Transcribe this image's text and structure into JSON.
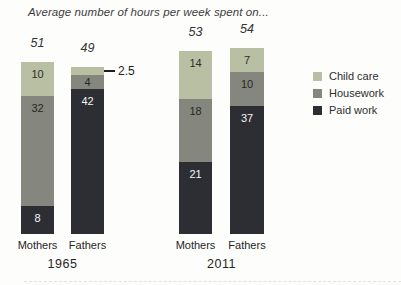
{
  "chart_data": {
    "type": "bar",
    "stacked": true,
    "title": "Average number of hours per week spent on...",
    "series_order": [
      "child_care",
      "housework",
      "paid_work"
    ],
    "legend": [
      {
        "key": "child_care",
        "label": "Child care",
        "color": "#b8bfa3",
        "label_color": "#2e2f2b"
      },
      {
        "key": "housework",
        "label": "Housework",
        "color": "#85877e",
        "label_color": "#262723"
      },
      {
        "key": "paid_work",
        "label": "Paid work",
        "color": "#2c2e33",
        "label_color": "#f5f5f4"
      }
    ],
    "legend_position": "right",
    "unit": "hours per week",
    "groups": [
      {
        "year": "1965",
        "bars": [
          {
            "label": "Mothers",
            "total": "51",
            "segments": {
              "child_care": 10,
              "housework": 32,
              "paid_work": 8
            },
            "segment_labels": {
              "child_care": "10",
              "housework": "32",
              "paid_work": "8"
            }
          },
          {
            "label": "Fathers",
            "total": "49",
            "segments": {
              "child_care": 2.5,
              "housework": 4,
              "paid_work": 42
            },
            "segment_labels": {
              "child_care": "",
              "housework": "4",
              "paid_work": "42"
            },
            "callout": {
              "segment": "child_care",
              "text": "2.5"
            }
          }
        ]
      },
      {
        "year": "2011",
        "bars": [
          {
            "label": "Mothers",
            "total": "53",
            "segments": {
              "child_care": 14,
              "housework": 18,
              "paid_work": 21
            },
            "segment_labels": {
              "child_care": "14",
              "housework": "18",
              "paid_work": "21"
            }
          },
          {
            "label": "Fathers",
            "total": "54",
            "segments": {
              "child_care": 7,
              "housework": 10,
              "paid_work": 37
            },
            "segment_labels": {
              "child_care": "7",
              "housework": "10",
              "paid_work": "37"
            }
          }
        ]
      }
    ]
  }
}
